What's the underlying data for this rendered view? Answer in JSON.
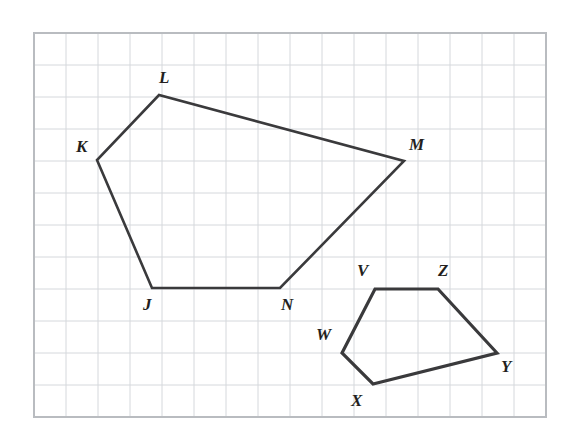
{
  "figure": {
    "background_color": "#ffffff",
    "grid": {
      "border_color": "#b9bcc0",
      "line_color": "#d5d8dc",
      "cell_size": 32,
      "origin_x": 34,
      "origin_y": 33,
      "columns": 16,
      "rows": 12,
      "border_width": 2,
      "line_width": 1
    },
    "stroke_color": "#3a3a3c",
    "label_color": "#231f20"
  },
  "chart_data": {
    "type": "scatter",
    "xlabel": "",
    "ylabel": "",
    "grid": true,
    "legend": "none",
    "xlim": [
      0,
      16
    ],
    "ylim": [
      0,
      12
    ],
    "series": [
      {
        "name": "Pentagon JKLMN",
        "closed": true,
        "stroke_width": 2.6,
        "points": [
          {
            "label": "J",
            "x": 152,
            "y": 288,
            "grid_x": 3.7,
            "grid_y": 4.0
          },
          {
            "label": "K",
            "x": 97,
            "y": 160,
            "grid_x": 2.0,
            "grid_y": 8.0
          },
          {
            "label": "L",
            "x": 159,
            "y": 95,
            "grid_x": 3.9,
            "grid_y": 10.1
          },
          {
            "label": "M",
            "x": 404,
            "y": 161,
            "grid_x": 11.6,
            "grid_y": 8.0
          },
          {
            "label": "N",
            "x": 280,
            "y": 288,
            "grid_x": 7.7,
            "grid_y": 4.0
          }
        ]
      },
      {
        "name": "Pentagon VWXYZ",
        "closed": true,
        "stroke_width": 3.2,
        "points": [
          {
            "label": "V",
            "x": 375,
            "y": 289,
            "grid_x": 10.7,
            "grid_y": 4.0
          },
          {
            "label": "Z",
            "x": 438,
            "y": 289,
            "grid_x": 12.6,
            "grid_y": 4.0
          },
          {
            "label": "Y",
            "x": 497,
            "y": 353,
            "grid_x": 14.5,
            "grid_y": 2.0
          },
          {
            "label": "X",
            "x": 373,
            "y": 384,
            "grid_x": 10.6,
            "grid_y": 1.0
          },
          {
            "label": "W",
            "x": 342,
            "y": 353,
            "grid_x": 9.6,
            "grid_y": 2.0
          }
        ]
      }
    ]
  },
  "labels": [
    {
      "name": "vertex-label-j",
      "text": "J",
      "x": 143,
      "y": 296
    },
    {
      "name": "vertex-label-k",
      "text": "K",
      "x": 76,
      "y": 138
    },
    {
      "name": "vertex-label-l",
      "text": "L",
      "x": 159,
      "y": 69
    },
    {
      "name": "vertex-label-m",
      "text": "M",
      "x": 409,
      "y": 136
    },
    {
      "name": "vertex-label-n",
      "text": "N",
      "x": 281,
      "y": 296
    },
    {
      "name": "vertex-label-v",
      "text": "V",
      "x": 357,
      "y": 262
    },
    {
      "name": "vertex-label-z",
      "text": "Z",
      "x": 438,
      "y": 262
    },
    {
      "name": "vertex-label-w",
      "text": "W",
      "x": 316,
      "y": 326
    },
    {
      "name": "vertex-label-x",
      "text": "X",
      "x": 351,
      "y": 392
    },
    {
      "name": "vertex-label-y",
      "text": "Y",
      "x": 501,
      "y": 358
    }
  ]
}
